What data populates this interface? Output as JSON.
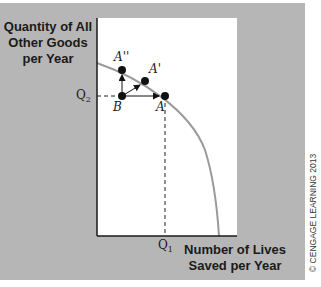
{
  "diagram": {
    "type": "production-possibilities-frontier",
    "y_axis_label": "Quantity of All Other Goods per Year",
    "y_axis_label_lines": [
      "Quantity of All",
      "Other Goods",
      "per Year"
    ],
    "x_axis_label_lines": [
      "Number of Lives",
      "Saved per Year"
    ],
    "x_axis_label": "Number of Lives Saved per Year",
    "tick_labels": {
      "q1": {
        "base": "Q",
        "sub": "1"
      },
      "q2": {
        "base": "Q",
        "sub": "2"
      }
    },
    "points": [
      {
        "id": "A_double_prime",
        "label": "A''",
        "on_curve": true
      },
      {
        "id": "A_prime",
        "label": "A'",
        "on_curve": true
      },
      {
        "id": "A",
        "label": "A",
        "on_curve": true
      },
      {
        "id": "B",
        "label": "B",
        "on_curve": false
      }
    ],
    "arrows": [
      {
        "from": "B",
        "to": "A''"
      },
      {
        "from": "B",
        "to": "A'"
      },
      {
        "from": "B",
        "to": "A"
      }
    ],
    "copyright": "© CENGAGE LEARNING 2013",
    "colors": {
      "background_panel": "#b6b6b6",
      "plot_area": "#ffffff",
      "curve": "#9a9a9a",
      "axes": "#1a1a1a",
      "points": "#111111"
    }
  }
}
